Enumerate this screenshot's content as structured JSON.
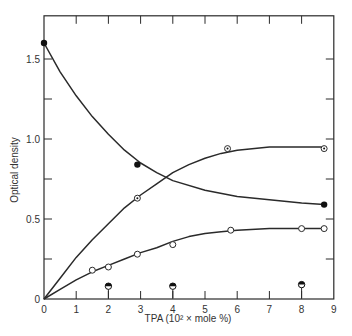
{
  "chart_data": {
    "type": "line",
    "title": "",
    "xlabel": "TPA (10² × mole %)",
    "ylabel": "Optical density",
    "xlim": [
      0,
      9
    ],
    "ylim": [
      0,
      1.77
    ],
    "x_ticks": [
      0,
      1,
      2,
      3,
      4,
      5,
      6,
      7,
      8,
      9
    ],
    "y_ticks": [
      0,
      0.25,
      0.5,
      0.75,
      1.0,
      1.25,
      1.5
    ],
    "y_tick_labels": {
      "0": "0",
      "0.5": "0.5",
      "1.0": "1.0",
      "1.5": "1.5"
    },
    "grid": false,
    "legend": null,
    "series": [
      {
        "name": "filled circles (decreasing)",
        "marker": "filled-circle",
        "points": [
          [
            0,
            1.6
          ],
          [
            2.9,
            0.84
          ],
          [
            8.7,
            0.59
          ]
        ],
        "curve": [
          [
            0,
            1.6
          ],
          [
            0.5,
            1.42
          ],
          [
            1,
            1.27
          ],
          [
            1.5,
            1.14
          ],
          [
            2,
            1.03
          ],
          [
            2.5,
            0.93
          ],
          [
            3,
            0.85
          ],
          [
            3.5,
            0.79
          ],
          [
            4,
            0.74
          ],
          [
            5,
            0.68
          ],
          [
            6,
            0.64
          ],
          [
            7,
            0.62
          ],
          [
            8,
            0.6
          ],
          [
            8.7,
            0.59
          ]
        ]
      },
      {
        "name": "dotted circles (upper rising)",
        "marker": "dotted-circle",
        "points": [
          [
            2.9,
            0.63
          ],
          [
            5.7,
            0.94
          ],
          [
            8.7,
            0.94
          ]
        ],
        "curve": [
          [
            0,
            0
          ],
          [
            0.5,
            0.13
          ],
          [
            1,
            0.26
          ],
          [
            1.5,
            0.37
          ],
          [
            2,
            0.47
          ],
          [
            2.5,
            0.57
          ],
          [
            3,
            0.65
          ],
          [
            3.5,
            0.72
          ],
          [
            4,
            0.79
          ],
          [
            4.5,
            0.84
          ],
          [
            5,
            0.88
          ],
          [
            5.5,
            0.91
          ],
          [
            6,
            0.93
          ],
          [
            7,
            0.95
          ],
          [
            8,
            0.95
          ],
          [
            8.7,
            0.95
          ]
        ]
      },
      {
        "name": "open circles (lower rising)",
        "marker": "open-circle",
        "points": [
          [
            1.5,
            0.18
          ],
          [
            2.0,
            0.2
          ],
          [
            2.9,
            0.28
          ],
          [
            4.0,
            0.34
          ],
          [
            5.8,
            0.43
          ],
          [
            8.0,
            0.44
          ],
          [
            8.7,
            0.44
          ]
        ],
        "curve": [
          [
            0,
            0
          ],
          [
            0.5,
            0.06
          ],
          [
            1,
            0.12
          ],
          [
            1.5,
            0.17
          ],
          [
            2,
            0.21
          ],
          [
            2.5,
            0.25
          ],
          [
            3,
            0.29
          ],
          [
            3.5,
            0.32
          ],
          [
            4,
            0.36
          ],
          [
            4.5,
            0.39
          ],
          [
            5,
            0.41
          ],
          [
            5.5,
            0.42
          ],
          [
            6,
            0.43
          ],
          [
            7,
            0.44
          ],
          [
            8,
            0.44
          ],
          [
            8.7,
            0.44
          ]
        ]
      },
      {
        "name": "half-filled circles",
        "marker": "half-filled-circle",
        "points": [
          [
            2,
            0.08
          ],
          [
            4,
            0.08
          ],
          [
            8,
            0.09
          ]
        ],
        "curve": null
      }
    ]
  }
}
